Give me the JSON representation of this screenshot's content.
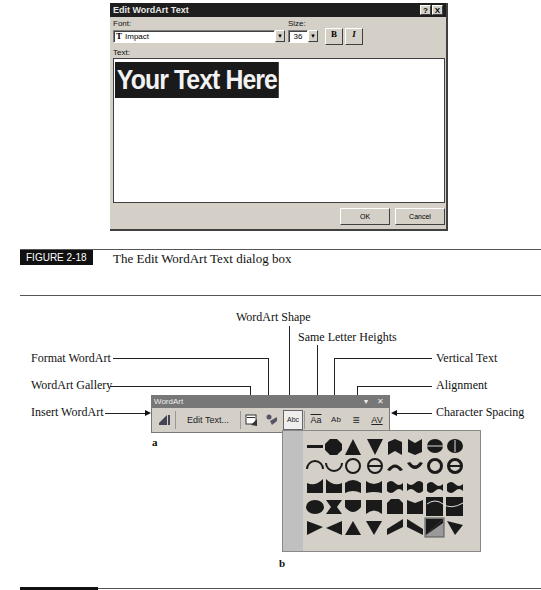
{
  "dialog": {
    "title": "Edit WordArt Text",
    "help_label": "?",
    "close_label": "X",
    "font_label": "Font:",
    "font_value": "Impact",
    "font_icon": "truetype-icon",
    "size_label": "Size:",
    "size_value": "36",
    "bold_label": "B",
    "italic_label": "I",
    "text_label": "Text:",
    "text_value": "Your Text Here",
    "ok_label": "OK",
    "cancel_label": "Cancel"
  },
  "figure_18": {
    "label": "FIGURE 2-18",
    "caption": "The Edit WordArt Text dialog box"
  },
  "callouts": {
    "wordart_shape": "WordArt Shape",
    "same_letter_heights": "Same Letter Heights",
    "format_wordart": "Format WordArt",
    "vertical_text": "Vertical Text",
    "wordart_gallery": "WordArt Gallery",
    "alignment": "Alignment",
    "insert_wordart": "Insert WordArt",
    "character_spacing": "Character Spacing"
  },
  "toolbar": {
    "title": "WordArt",
    "menu_label": "▾",
    "close_label": "✕",
    "edit_text_label": "Edit Text...",
    "shape_label": "Abc",
    "same_heights_label": "Aa",
    "vertical_label": "Ab",
    "alignment_label": "≡",
    "spacing_label": "AV"
  },
  "sublabels": {
    "a": "a",
    "b": "b"
  },
  "gallery": {
    "rows": 5,
    "cols": 9,
    "selected_index": 43
  },
  "colors": {
    "dialog_face": "#d4d0c8",
    "title_bar": "#1e1e1e",
    "toolbar_title": "#777777",
    "figure_label_bg": "#111111"
  }
}
